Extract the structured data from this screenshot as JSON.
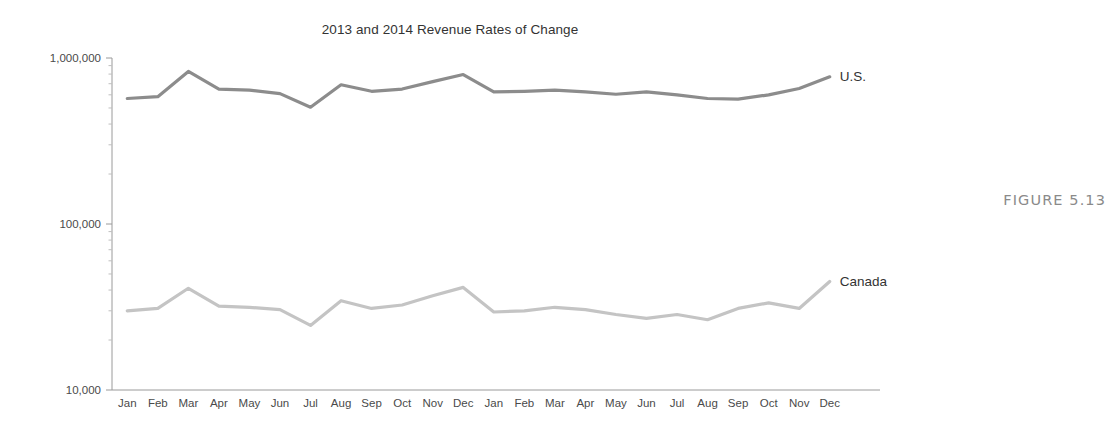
{
  "figure": {
    "caption": "FIGURE 5.13"
  },
  "chart_data": {
    "type": "line",
    "title": "2013 and 2014 Revenue Rates of Change",
    "xlabel": "",
    "ylabel": "",
    "yscale": "log",
    "ylim": [
      10000,
      1000000
    ],
    "ytick_labels": [
      "1,000,000",
      "100,000",
      "10,000"
    ],
    "ytick_values": [
      1000000,
      100000,
      10000
    ],
    "grid": false,
    "legend_position": "right-inline-labels",
    "categories": [
      "Jan",
      "Feb",
      "Mar",
      "Apr",
      "May",
      "Jun",
      "Jul",
      "Aug",
      "Sep",
      "Oct",
      "Nov",
      "Dec",
      "Jan",
      "Feb",
      "Mar",
      "Apr",
      "May",
      "Jun",
      "Jul",
      "Aug",
      "Sep",
      "Oct",
      "Nov",
      "Dec"
    ],
    "series": [
      {
        "name": "U.S.",
        "color": "#8c8c8c",
        "values": [
          570000,
          585000,
          830000,
          650000,
          640000,
          610000,
          505000,
          690000,
          630000,
          650000,
          720000,
          795000,
          625000,
          630000,
          640000,
          625000,
          605000,
          625000,
          600000,
          570000,
          565000,
          600000,
          655000,
          770000
        ]
      },
      {
        "name": "Canada",
        "color": "#c4c4c4",
        "values": [
          30000,
          31000,
          41000,
          32000,
          31500,
          30500,
          24500,
          34500,
          31000,
          32500,
          37000,
          41500,
          29500,
          30000,
          31500,
          30500,
          28500,
          27000,
          28500,
          26500,
          31000,
          33500,
          31000,
          45000
        ]
      }
    ]
  }
}
